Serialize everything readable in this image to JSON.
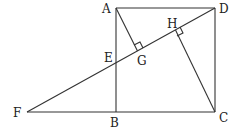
{
  "diagram": {
    "title": "",
    "points": {
      "A": {
        "label": "A",
        "x": 116,
        "y": 8
      },
      "D": {
        "label": "D",
        "x": 215,
        "y": 8
      },
      "B": {
        "label": "B",
        "x": 116,
        "y": 112
      },
      "C": {
        "label": "C",
        "x": 215,
        "y": 112
      },
      "F": {
        "label": "F",
        "x": 27,
        "y": 112
      },
      "E": {
        "label": "E",
        "x": 116,
        "y": 64
      },
      "G": {
        "label": "G",
        "x": 137,
        "y": 52
      },
      "H": {
        "label": "H",
        "x": 175,
        "y": 31
      }
    },
    "segments": [
      "AD",
      "DC",
      "CB",
      "BA",
      "FC",
      "FD",
      "AG",
      "CH"
    ],
    "right_angles": [
      "AGD",
      "CHD"
    ]
  }
}
